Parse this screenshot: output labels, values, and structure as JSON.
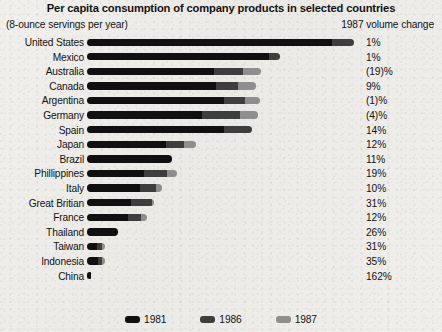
{
  "chart_data": {
    "type": "bar",
    "subtype": "stacked-horizontal-bar",
    "title": "Per capita consumption of company products in selected countries",
    "subtitle": "(8-ounce servings per year)",
    "column_header": "1987 volume change",
    "xlabel": "",
    "ylabel": "",
    "grid": false,
    "legend_position": "bottom",
    "legend": [
      {
        "name": "1981",
        "color": "#101010"
      },
      {
        "name": "1986",
        "color": "#3e3e3e"
      },
      {
        "name": "1987",
        "color": "#8e8e8e"
      }
    ],
    "categories": [
      "United States",
      "Mexico",
      "Australia",
      "Canada",
      "Argentina",
      "Germany",
      "Spain",
      "Japan",
      "Brazil",
      "Phillippines",
      "Italy",
      "Great Britian",
      "France",
      "Thailand",
      "Taiwan",
      "Indonesia",
      "China"
    ],
    "series": [
      {
        "name": "1981",
        "color": "#101010",
        "values": [
          243,
          181,
          126,
          128,
          136,
          114,
          136,
          78,
          84,
          57,
          53,
          44,
          41,
          31,
          10,
          11,
          4
        ]
      },
      {
        "name": "1986",
        "color": "#3e3e3e",
        "values": [
          22,
          11,
          29,
          22,
          21,
          38,
          28,
          18,
          0,
          22,
          15,
          21,
          13,
          0,
          5,
          4,
          0
        ]
      },
      {
        "name": "1987",
        "color": "#8e8e8e",
        "values": [
          0,
          0,
          18,
          18,
          15,
          18,
          0,
          12,
          0,
          10,
          6,
          2,
          6,
          0,
          3,
          3,
          0
        ]
      }
    ],
    "volume_change_1987": [
      "1%",
      "1%",
      "(19)%",
      "9%",
      "(1)%",
      "(4)%",
      "14%",
      "12%",
      "11%",
      "19%",
      "10%",
      "31%",
      "12%",
      "26%",
      "31%",
      "35%",
      "162%"
    ],
    "axis_max": 270
  }
}
